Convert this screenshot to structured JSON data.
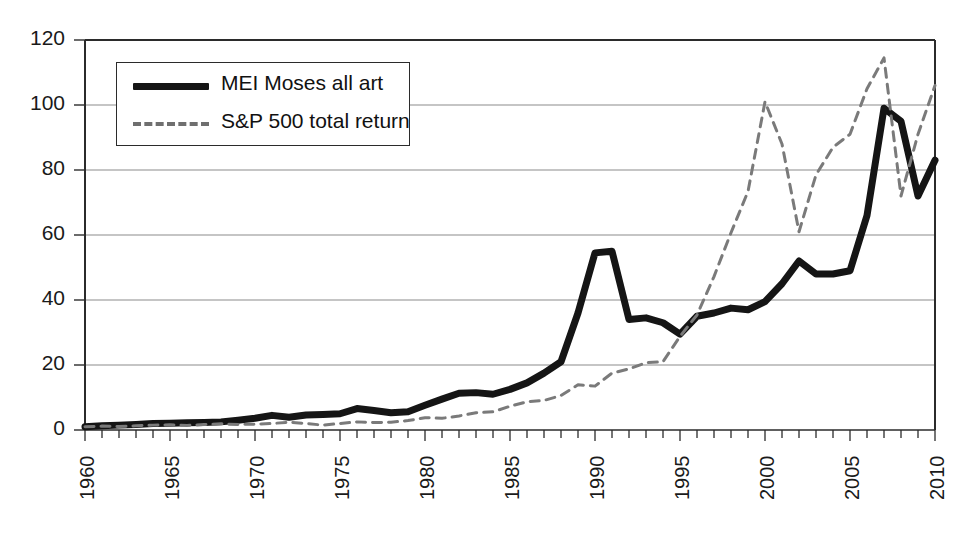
{
  "chart_data": {
    "type": "line",
    "title": "",
    "subtitle": "",
    "xlabel": "",
    "ylabel": "",
    "xlim": [
      1960,
      2010
    ],
    "ylim": [
      0,
      120
    ],
    "yticks": [
      0,
      20,
      40,
      60,
      80,
      100,
      120
    ],
    "xticks": [
      1960,
      1965,
      1970,
      1975,
      1980,
      1985,
      1990,
      1995,
      2000,
      2005,
      2010
    ],
    "xtick_rotation": 90,
    "minor_xtick_interval": 1,
    "grid": "horizontal",
    "legend_position": "upper-left",
    "x": [
      1960,
      1961,
      1962,
      1963,
      1964,
      1965,
      1966,
      1967,
      1968,
      1969,
      1970,
      1971,
      1972,
      1973,
      1974,
      1975,
      1976,
      1977,
      1978,
      1979,
      1980,
      1981,
      1982,
      1983,
      1984,
      1985,
      1986,
      1987,
      1988,
      1989,
      1990,
      1991,
      1992,
      1993,
      1994,
      1995,
      1996,
      1997,
      1998,
      1999,
      2000,
      2001,
      2002,
      2003,
      2004,
      2005,
      2006,
      2007,
      2008,
      2009,
      2010
    ],
    "series": [
      {
        "name": "MEI Moses all art",
        "style": "solid",
        "color": "#151515",
        "width": 7,
        "values": [
          1.0,
          1.3,
          1.5,
          1.7,
          2.0,
          2.1,
          2.2,
          2.3,
          2.5,
          3.0,
          3.6,
          4.5,
          3.9,
          4.6,
          4.8,
          5.0,
          6.6,
          6.0,
          5.3,
          5.6,
          7.6,
          9.5,
          11.3,
          11.5,
          11.0,
          12.5,
          14.5,
          17.5,
          21.0,
          36.0,
          54.5,
          55.0,
          34.0,
          34.5,
          33.0,
          29.5,
          35.0,
          36.0,
          37.5,
          37.0,
          39.5,
          45.0,
          52.0,
          48.0,
          48.0,
          49.0,
          66.0,
          99.0,
          95.0,
          72.0,
          83.0
        ]
      },
      {
        "name": "S&P 500 total return",
        "style": "dashed",
        "color": "#7a7a7a",
        "width": 3,
        "values": [
          1.0,
          1.2,
          1.1,
          1.3,
          1.5,
          1.6,
          1.4,
          1.7,
          1.9,
          1.7,
          1.8,
          2.0,
          2.4,
          2.0,
          1.5,
          2.0,
          2.5,
          2.3,
          2.4,
          2.9,
          3.8,
          3.6,
          4.3,
          5.3,
          5.6,
          7.3,
          8.7,
          9.1,
          10.6,
          13.9,
          13.5,
          17.5,
          18.8,
          20.7,
          21.0,
          28.8,
          35.4,
          47.2,
          60.7,
          73.4,
          101.0,
          88.0,
          61.0,
          78.5,
          87.0,
          91.0,
          105.0,
          114.5,
          72.0,
          91.0,
          106.0
        ]
      }
    ]
  },
  "legend": {
    "items": [
      {
        "label": "MEI Moses all art",
        "marker": "solid-line-swatch"
      },
      {
        "label": "S&P 500 total return",
        "marker": "dashed-line-swatch"
      }
    ]
  },
  "axis": {
    "y_labels": [
      "120",
      "100",
      "80",
      "60",
      "40",
      "20",
      "0"
    ],
    "x_labels": [
      "1960",
      "1965",
      "1970",
      "1975",
      "1980",
      "1985",
      "1990",
      "1995",
      "2000",
      "2005",
      "2010"
    ]
  }
}
